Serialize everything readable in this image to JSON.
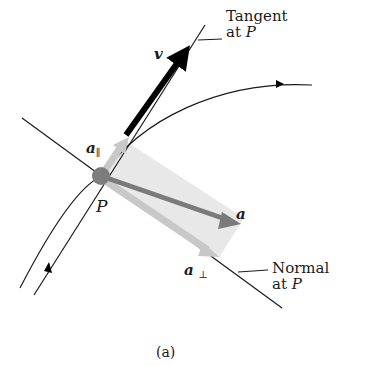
{
  "diagram": {
    "caption": "(a)",
    "point_label": "P",
    "tangent_label": {
      "line1": "Tangent",
      "line2_prefix": "at ",
      "line2_point": "P"
    },
    "normal_label": {
      "line1": "Normal",
      "line2_prefix": "at ",
      "line2_point": "P"
    },
    "vectors": {
      "velocity": {
        "symbol": "v",
        "color": "#000000"
      },
      "acceleration": {
        "symbol": "a",
        "color": "#7a7a7a"
      },
      "parallel_component": {
        "symbol": "a",
        "subscript": "∥",
        "color": "#c8c8c8"
      },
      "perpendicular_component": {
        "symbol": "a",
        "subscript": "⊥",
        "color": "#c8c8c8"
      }
    },
    "colors": {
      "point": "#7d7d7d",
      "parallelogram_fill": "#e6e6e6",
      "lines": "#1a1a1a"
    }
  }
}
